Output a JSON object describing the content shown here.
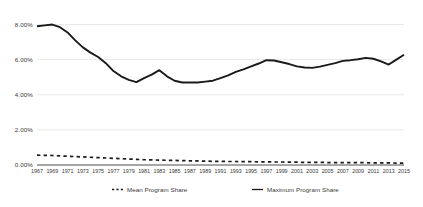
{
  "chart_data": {
    "type": "line",
    "title": "",
    "subtitle": "",
    "xlabel": "",
    "ylabel": "",
    "grid": true,
    "legend_position": "bottom",
    "ylim": [
      0,
      8.6
    ],
    "ytick_values": [
      0,
      2,
      4,
      6,
      8
    ],
    "ytick_labels": [
      "0.00%",
      "2.00%",
      "4.00%",
      "6.00%",
      "8.00%"
    ],
    "xlim": [
      1967,
      2015
    ],
    "x": [
      1967,
      1968,
      1969,
      1970,
      1971,
      1972,
      1973,
      1974,
      1975,
      1976,
      1977,
      1978,
      1979,
      1980,
      1981,
      1982,
      1983,
      1984,
      1985,
      1986,
      1987,
      1988,
      1989,
      1990,
      1991,
      1992,
      1993,
      1994,
      1995,
      1996,
      1997,
      1998,
      1999,
      2000,
      2001,
      2002,
      2003,
      2004,
      2005,
      2006,
      2007,
      2008,
      2009,
      2010,
      2011,
      2012,
      2013,
      2014,
      2015
    ],
    "xtick_labels": [
      "1967",
      "1969",
      "1971",
      "1973",
      "1975",
      "1977",
      "1979",
      "1981",
      "1983",
      "1985",
      "1987",
      "1989",
      "1991",
      "1993",
      "1995",
      "1997",
      "1999",
      "2001",
      "2003",
      "2005",
      "2007",
      "2009",
      "2011",
      "2013",
      "2015"
    ],
    "xtick_values": [
      1967,
      1969,
      1971,
      1973,
      1975,
      1977,
      1979,
      1981,
      1983,
      1985,
      1987,
      1989,
      1991,
      1993,
      1995,
      1997,
      1999,
      2001,
      2003,
      2005,
      2007,
      2009,
      2011,
      2013,
      2015
    ],
    "series": [
      {
        "name": "Maximum Program Share",
        "style": "solid",
        "color": "#1a1a1a",
        "values": [
          7.9,
          7.95,
          8.0,
          7.85,
          7.55,
          7.1,
          6.7,
          6.4,
          6.15,
          5.8,
          5.35,
          5.05,
          4.85,
          4.72,
          4.95,
          5.15,
          5.4,
          5.05,
          4.8,
          4.7,
          4.7,
          4.7,
          4.75,
          4.8,
          4.95,
          5.1,
          5.3,
          5.45,
          5.62,
          5.78,
          5.97,
          5.95,
          5.85,
          5.75,
          5.62,
          5.55,
          5.53,
          5.6,
          5.7,
          5.8,
          5.93,
          5.97,
          6.02,
          6.1,
          6.05,
          5.9,
          5.72,
          6.0,
          6.28
        ]
      },
      {
        "name": "Mean Program Share",
        "style": "dashed",
        "color": "#1a1a1a",
        "values": [
          0.56,
          0.55,
          0.54,
          0.52,
          0.5,
          0.48,
          0.46,
          0.44,
          0.42,
          0.4,
          0.38,
          0.36,
          0.34,
          0.32,
          0.3,
          0.29,
          0.28,
          0.27,
          0.26,
          0.25,
          0.24,
          0.23,
          0.22,
          0.21,
          0.21,
          0.2,
          0.2,
          0.19,
          0.19,
          0.18,
          0.18,
          0.17,
          0.17,
          0.16,
          0.16,
          0.15,
          0.15,
          0.15,
          0.14,
          0.14,
          0.14,
          0.13,
          0.13,
          0.13,
          0.12,
          0.12,
          0.12,
          0.11,
          0.11
        ]
      }
    ]
  },
  "legend": {
    "mean_label": "Mean Program Share",
    "max_label": "Maximum Program Share"
  },
  "axis_colors": {
    "grid": "#d9d9d9",
    "axis": "#3a3a3a",
    "text": "#3a3a3a",
    "line": "#1a1a1a"
  }
}
